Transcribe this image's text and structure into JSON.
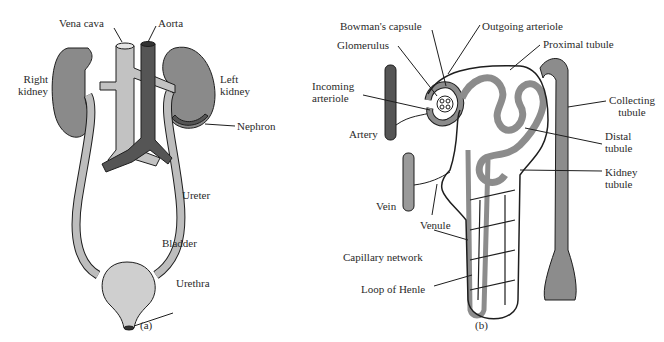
{
  "panel_a": {
    "caption": "(a)",
    "labels": {
      "vena_cava": "Vena cava",
      "aorta": "Aorta",
      "right_kidney": "Right\nkidney",
      "left_kidney": "Left\nkidney",
      "nephron": "Nephron",
      "ureter": "Ureter",
      "bladder": "Bladder",
      "urethra": "Urethra"
    }
  },
  "panel_b": {
    "caption": "(b)",
    "labels": {
      "bowmans_capsule": "Bowman's capsule",
      "outgoing_arteriole": "Outgoing arteriole",
      "glomerulus": "Glomerulus",
      "proximal_tubule": "Proximal tubule",
      "incoming_arteriole": "Incoming\narteriole",
      "artery": "Artery",
      "collecting_tubule": "Collecting\ntubule",
      "distal_tubule": "Distal\ntubule",
      "kidney_tubule": "Kidney\ntubule",
      "vein": "Vein",
      "venule": "Venule",
      "capillary_network": "Capillary network",
      "loop_of_henle": "Loop of Henle"
    }
  },
  "colors": {
    "kidney": "#8a8a8a",
    "vena_cava": "#c2c2c2",
    "aorta": "#555555",
    "ureter": "#bdbdbd",
    "bladder": "#cfcfcf",
    "tubule": "#8c8c8c",
    "outline": "#1e1e1e"
  }
}
